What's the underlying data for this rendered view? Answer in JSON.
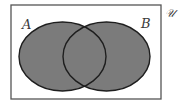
{
  "diagram": {
    "type": "venn",
    "universe": {
      "label": "𝒰",
      "rect": {
        "x": 11,
        "y": 5,
        "width": 150,
        "height": 94
      },
      "stroke": "#555555",
      "fill": "#ffffff"
    },
    "sets": [
      {
        "name": "A",
        "label": "A",
        "cx": 62.5,
        "cy": 56.5,
        "rx": 43.5,
        "ry": 34.5,
        "label_x": 22,
        "label_y": 29
      },
      {
        "name": "B",
        "label": "B",
        "cx": 106.5,
        "cy": 56.5,
        "rx": 43.5,
        "ry": 34.5,
        "label_x": 141,
        "label_y": 28
      }
    ],
    "shaded_region": "A ∪ B",
    "fill_color": "#7b7b7b",
    "outline_color": "#1e1e1e"
  }
}
